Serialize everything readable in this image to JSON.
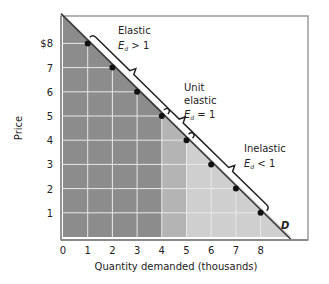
{
  "chart_data": {
    "type": "line",
    "title": "",
    "xlabel": "Quantity demanded (thousands)",
    "ylabel": "Price",
    "x_ticks": [
      "0",
      "1",
      "2",
      "3",
      "4",
      "5",
      "6",
      "7",
      "8"
    ],
    "y_ticks": [
      "1",
      "2",
      "3",
      "4",
      "5",
      "6",
      "7",
      "$8"
    ],
    "xlim": [
      0,
      10
    ],
    "ylim": [
      0,
      9.2
    ],
    "grid": true,
    "series": [
      {
        "name": "D",
        "x": [
          1,
          2,
          3,
          4,
          5,
          6,
          7,
          8
        ],
        "y": [
          8,
          7,
          6,
          5,
          4,
          3,
          2,
          1
        ],
        "line_from": [
          0,
          9.15
        ],
        "line_to": [
          9.25,
          0
        ]
      }
    ],
    "shaded_regions": [
      {
        "label": "Elastic region",
        "x_range": [
          0,
          4
        ],
        "color": "#8c8c8c"
      },
      {
        "label": "Unit elastic region",
        "x_range": [
          4,
          5
        ],
        "color": "#b4b4b4"
      },
      {
        "label": "Inelastic region",
        "x_range": [
          5,
          9.25
        ],
        "color": "#cfcfcf"
      }
    ],
    "annotations": [
      {
        "text": "Elastic",
        "sub": "Ed > 1",
        "span": [
          [
            1,
            8
          ],
          [
            4,
            5
          ]
        ]
      },
      {
        "text": "Unit elastic",
        "sub": "Ed = 1",
        "span": [
          [
            4,
            5
          ],
          [
            5,
            4
          ]
        ]
      },
      {
        "text": "Inelastic",
        "sub": "Ed < 1",
        "span": [
          [
            5,
            4
          ],
          [
            8,
            1
          ]
        ]
      }
    ],
    "curve_label": "D"
  },
  "labels": {
    "y_axis": "Price",
    "x_axis": "Quantity demanded (thousands)",
    "curve": "D",
    "elastic_title": "Elastic",
    "elastic_E": "E",
    "elastic_sub": "d",
    "elastic_rel": " > 1",
    "unit_title_1": "Unit",
    "unit_title_2": "elastic",
    "unit_E": "E",
    "unit_sub": "d",
    "unit_rel": " = 1",
    "inelastic_title": "Inelastic",
    "inelastic_E": "E",
    "inelastic_sub": "d",
    "inelastic_rel": " < 1"
  }
}
